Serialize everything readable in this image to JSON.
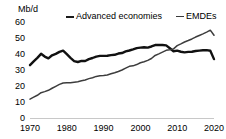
{
  "chart_data": {
    "type": "line",
    "title": "",
    "subtitle": "",
    "xlabel": "",
    "ylabel": "Mb/d",
    "unit_label": "Mb/d",
    "xlim": [
      1970,
      2020
    ],
    "ylim": [
      0,
      60
    ],
    "grid": false,
    "legend_position": "top",
    "y_ticks": [
      60,
      50,
      40,
      30,
      20,
      10,
      0
    ],
    "y_tick_labels": [
      "60",
      "50",
      "40",
      "30",
      "20",
      "10",
      "0"
    ],
    "x_ticks": [
      1970,
      1980,
      1990,
      2000,
      2010,
      2020
    ],
    "x_tick_labels": [
      "1970",
      "1980",
      "1990",
      "2000",
      "2010",
      "2020"
    ],
    "x": [
      1970,
      1971,
      1972,
      1973,
      1974,
      1975,
      1976,
      1977,
      1978,
      1979,
      1980,
      1981,
      1982,
      1983,
      1984,
      1985,
      1986,
      1987,
      1988,
      1989,
      1990,
      1991,
      1992,
      1993,
      1994,
      1995,
      1996,
      1997,
      1998,
      1999,
      2000,
      2001,
      2002,
      2003,
      2004,
      2005,
      2006,
      2007,
      2008,
      2009,
      2010,
      2011,
      2012,
      2013,
      2014,
      2015,
      2016,
      2017,
      2018,
      2019,
      2020
    ],
    "series": [
      {
        "name": "Advanced economies",
        "color": "#111111",
        "line_width": "thick",
        "values": [
          33.0,
          35.4,
          37.6,
          40.1,
          38.4,
          37.3,
          39.2,
          40.1,
          41.3,
          42.1,
          39.9,
          37.6,
          35.6,
          35.0,
          35.7,
          35.6,
          36.8,
          37.5,
          38.4,
          38.8,
          38.8,
          38.9,
          39.3,
          39.5,
          40.3,
          40.6,
          41.6,
          42.2,
          42.9,
          43.7,
          44.0,
          44.2,
          44.0,
          44.7,
          45.6,
          45.7,
          45.6,
          45.4,
          43.6,
          41.7,
          42.1,
          41.4,
          41.0,
          41.3,
          41.4,
          41.9,
          42.1,
          42.3,
          42.4,
          42.0,
          36.8
        ]
      },
      {
        "name": "EMDEs",
        "color": "#3d3d3d",
        "line_width": "thin",
        "values": [
          11.8,
          13.0,
          14.2,
          15.8,
          16.5,
          17.3,
          18.6,
          19.8,
          21.0,
          21.9,
          22.0,
          22.1,
          22.4,
          22.7,
          23.3,
          23.8,
          24.6,
          25.2,
          26.0,
          26.4,
          26.6,
          26.9,
          27.6,
          28.3,
          29.1,
          30.0,
          31.2,
          32.3,
          32.6,
          33.4,
          34.5,
          35.2,
          36.0,
          37.2,
          39.1,
          40.1,
          41.2,
          42.3,
          42.7,
          43.2,
          45.2,
          46.3,
          47.5,
          48.4,
          49.4,
          50.6,
          51.6,
          52.6,
          53.7,
          54.9,
          51.7
        ]
      }
    ]
  },
  "legend": {
    "entries": [
      {
        "label": "Advanced economies"
      },
      {
        "label": "EMDEs"
      }
    ]
  }
}
